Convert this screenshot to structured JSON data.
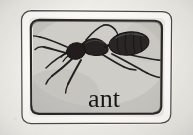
{
  "card": {
    "kind": "flashcard-illustration",
    "style": "hand-drawn engraving",
    "caption": "ant",
    "subject_icon": "ant-icon",
    "frame_icon": "hand-drawn-rounded-rect-frame-icon"
  },
  "colors": {
    "paper": "#f3f1ec",
    "panel": "#c9c7c2",
    "frame_white": "#fbfaf7",
    "ink": "#1d1c1a",
    "ink_soft": "#3c3a37",
    "caption": "#171615",
    "ant_body": "#232120",
    "ant_shade": "#4a4745"
  },
  "geometry": {
    "width": 193,
    "height": 135,
    "frame_outer": {
      "x": 20,
      "y": 11,
      "w": 154,
      "h": 113
    },
    "frame_inner": {
      "x": 30,
      "y": 20,
      "w": 134,
      "h": 95
    },
    "caption_box": {
      "x": 78,
      "y": 86,
      "w": 52,
      "h": 24
    }
  },
  "caption": {
    "text": "ant",
    "font_size_px": 26
  },
  "ant": {
    "label": "ant",
    "parts": [
      {
        "name": "head",
        "cx": 75,
        "cy": 51
      },
      {
        "name": "thorax",
        "cx": 96,
        "cy": 45
      },
      {
        "name": "gaster",
        "cx": 129,
        "cy": 44
      },
      {
        "name": "antenna-left",
        "from": [
          68,
          48
        ],
        "to": [
          44,
          39
        ]
      },
      {
        "name": "antenna-right",
        "from": [
          88,
          38
        ],
        "to": [
          104,
          25
        ]
      },
      {
        "name": "leg-front-left",
        "from": [
          72,
          55
        ],
        "to": [
          42,
          48
        ]
      },
      {
        "name": "leg-mid-left",
        "from": [
          76,
          58
        ],
        "to": [
          50,
          74
        ]
      },
      {
        "name": "leg-hind-left",
        "from": [
          82,
          59
        ],
        "to": [
          66,
          82
        ]
      },
      {
        "name": "leg-front-right",
        "from": [
          101,
          52
        ],
        "to": [
          124,
          66
        ]
      },
      {
        "name": "leg-mid-right",
        "from": [
          112,
          53
        ],
        "to": [
          150,
          72
        ]
      },
      {
        "name": "leg-hind-right",
        "from": [
          130,
          55
        ],
        "to": [
          160,
          60
        ]
      }
    ]
  }
}
